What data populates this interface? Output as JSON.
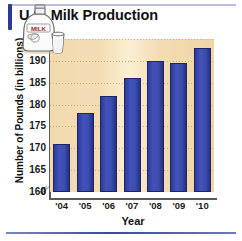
{
  "title": "U.S. Milk Production",
  "bottom_rule": true,
  "illustration": {
    "name": "milk-jug-and-glass",
    "label": "MILK"
  },
  "chart_data": {
    "type": "bar",
    "title": "U.S. Milk Production",
    "xlabel": "Year",
    "ylabel": "Number of Pounds (in billions)",
    "categories": [
      "'04",
      "'05",
      "'06",
      "'07",
      "'08",
      "'09",
      "'10"
    ],
    "values": [
      171,
      178,
      182,
      186,
      190,
      189.5,
      193
    ],
    "ylim": [
      160,
      195
    ],
    "yticks": [
      160,
      165,
      170,
      175,
      180,
      185,
      190,
      195
    ],
    "zero_tick": "0",
    "axis_break": true,
    "grid": true,
    "legend": "none",
    "bar_color": "#3a4cb0",
    "plot_background": "#f2dcb0"
  }
}
